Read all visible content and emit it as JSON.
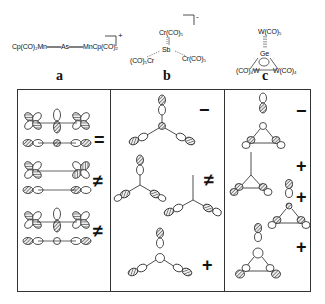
{
  "structures": {
    "a": {
      "label": "a",
      "formula": "Cp(CO)₂Mn═══As═══MnCp(CO)₂",
      "charge": "+"
    },
    "b": {
      "label": "b",
      "center": "Sb",
      "top": "Cr(CO)₅",
      "left": "(CO)₅Cr",
      "right": "Cr(CO)₅",
      "charge": "-"
    },
    "c": {
      "label": "c",
      "center": "Ge",
      "top": "W(CO)₅",
      "left": "(CO)₄W",
      "right": "W(CO)₄"
    }
  },
  "orbital_panels": {
    "a": {
      "symbols": [
        "=",
        "≠",
        "≠"
      ]
    },
    "b": {
      "symbols": [
        "−",
        "≠",
        "+"
      ]
    },
    "c": {
      "symbols": [
        "−",
        "+",
        "+",
        "+"
      ]
    }
  },
  "colors": {
    "line": "#333333",
    "hatch": "#555555"
  }
}
